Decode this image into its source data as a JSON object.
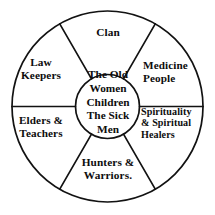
{
  "diagram": {
    "type": "wheel",
    "center": {
      "name": "center-core",
      "lines": [
        "The Old",
        "Women",
        "Children",
        "The Sick",
        "Men"
      ],
      "text": "The Old\nWomen\nChildren\nThe Sick\nMen"
    },
    "segments": [
      {
        "id": "clan",
        "label": "Clan",
        "position": "top"
      },
      {
        "id": "medicine",
        "label": "Medicine\nPeople",
        "position": "upper-right"
      },
      {
        "id": "spirituality",
        "label": "Spirituality\n& Spiritual\nHealers",
        "position": "lower-right"
      },
      {
        "id": "hunters",
        "label": "Hunters &\nWarriors.",
        "position": "bottom"
      },
      {
        "id": "elders",
        "label": "Elders &\nTeachers",
        "position": "lower-left"
      },
      {
        "id": "law",
        "label": "Law\nKeepers",
        "position": "upper-left"
      }
    ],
    "colors": {
      "stroke": "#121212",
      "background": "#ffffff",
      "text": "#0d0d0d"
    }
  }
}
